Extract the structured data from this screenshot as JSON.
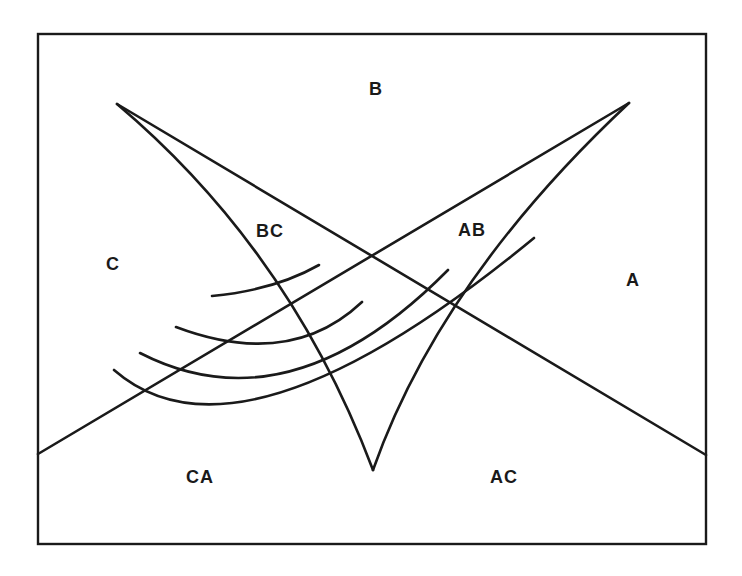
{
  "diagram": {
    "type": "region diagram (cusp / bifurcation sketch)",
    "frame": {
      "x": 38,
      "y": 34,
      "width": 668,
      "height": 510
    },
    "colors": {
      "ink": "#1a1a1a",
      "background": "#ffffff"
    },
    "regions": [
      {
        "id": "B",
        "label": "B",
        "x": 377,
        "y": 95
      },
      {
        "id": "C",
        "label": "C",
        "x": 113,
        "y": 270
      },
      {
        "id": "A",
        "label": "A",
        "x": 634,
        "y": 286
      },
      {
        "id": "BC",
        "label": "BC",
        "x": 273,
        "y": 237
      },
      {
        "id": "AB",
        "label": "AB",
        "x": 475,
        "y": 236
      },
      {
        "id": "CA",
        "label": "CA",
        "x": 204,
        "y": 483
      },
      {
        "id": "AC",
        "label": "AC",
        "x": 507,
        "y": 483
      }
    ],
    "lines": {
      "bc_straight": {
        "from": [
          117,
          104
        ],
        "to": [
          706,
          455
        ]
      },
      "ab_straight": {
        "from": [
          38,
          454
        ],
        "to": [
          629,
          103
        ]
      },
      "bc_cusp_curve": "M117,104 Q290,250 373,470",
      "ab_cusp_curve": "M629,103 Q440,280 373,470"
    },
    "arcs": [
      "M212,296 Q275,290 319,265",
      "M176,327 Q290,370 362,302",
      "M140,353 Q290,430 448,270",
      "M114,370 Q240,480 534,238"
    ]
  }
}
